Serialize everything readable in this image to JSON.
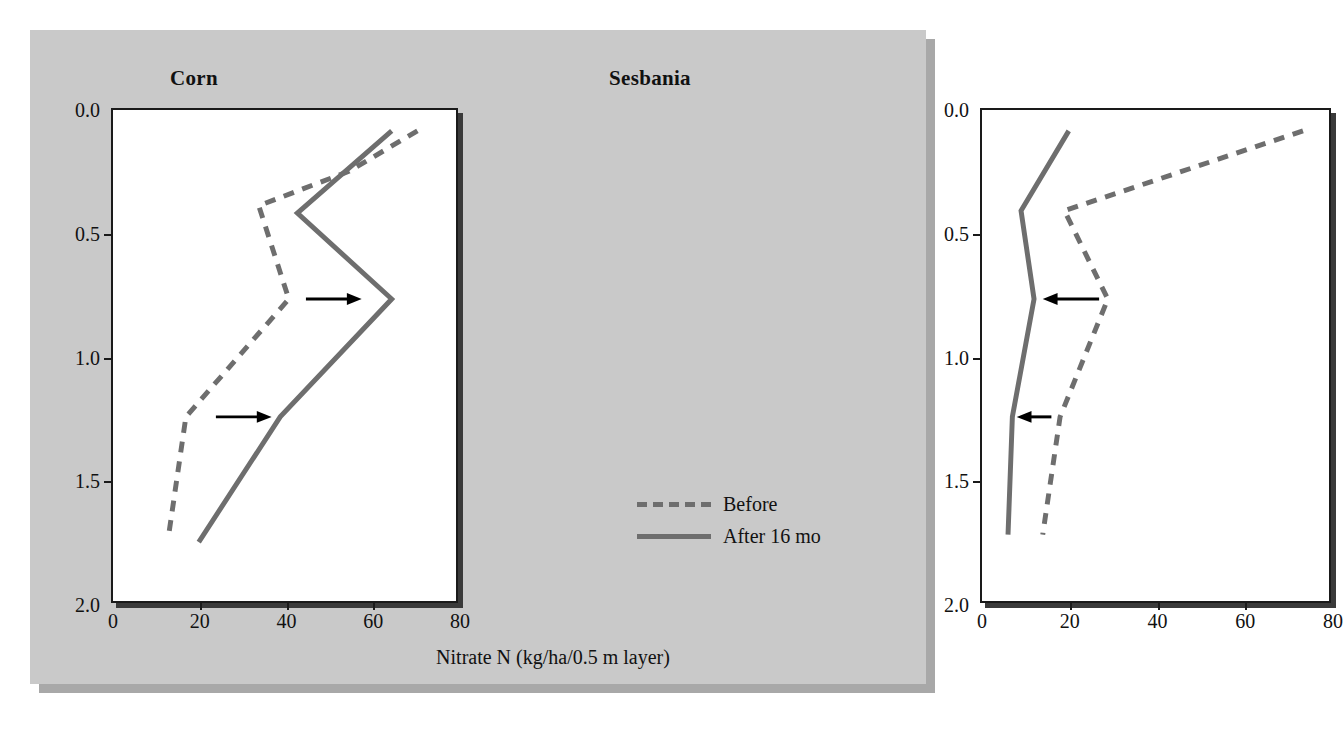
{
  "figure": {
    "background_color": "#c9c9c9",
    "plot_background_color": "#ffffff",
    "line_color": "#6e6e6e",
    "axis_color": "#1a1a1a",
    "arrow_color": "#000000"
  },
  "axis_title": "Nitrate N (kg/ha/0.5 m layer)",
  "legend": {
    "entries": [
      {
        "label": "Before",
        "style": "dashed"
      },
      {
        "label": "After 16 mo",
        "style": "solid"
      }
    ]
  },
  "chart_data": [
    {
      "type": "line",
      "title": "Corn",
      "xlabel": "Nitrate N (kg/ha/0.5 m layer)",
      "ylabel": "Depth (m)",
      "xlim": [
        0,
        80
      ],
      "ylim": [
        0,
        2.0
      ],
      "y_inverted": true,
      "grid": false,
      "legend_position": "bottom-right of right panel",
      "xticks": [
        0,
        20,
        40,
        60,
        80
      ],
      "yticks": [
        0.0,
        0.5,
        1.0,
        1.5,
        2.0
      ],
      "xticklabels": [
        "0",
        "20",
        "40",
        "60",
        "80"
      ],
      "yticklabels": [
        "0.0",
        "0.5",
        "1.0",
        "1.5",
        "2.0"
      ],
      "series": [
        {
          "name": "Before",
          "style": "dashed",
          "depth": [
            0.085,
            0.25,
            0.39,
            0.77,
            1.25,
            1.73
          ],
          "values": [
            71,
            55,
            34,
            41,
            17,
            13
          ]
        },
        {
          "name": "After 16 mo",
          "style": "solid",
          "depth": [
            0.085,
            0.42,
            0.77,
            1.25,
            1.76
          ],
          "values": [
            65,
            43,
            65,
            39,
            20
          ]
        }
      ],
      "annotations": [
        {
          "type": "arrow",
          "direction": "right",
          "depth": 0.77,
          "x_from": 45,
          "x_to": 58
        },
        {
          "type": "arrow",
          "direction": "right",
          "depth": 1.25,
          "x_from": 24,
          "x_to": 37
        }
      ]
    },
    {
      "type": "line",
      "title": "Sesbania",
      "xlabel": "Nitrate N (kg/ha/0.5 m layer)",
      "ylabel": "Depth (m)",
      "xlim": [
        0,
        80
      ],
      "ylim": [
        0,
        2.0
      ],
      "y_inverted": true,
      "grid": false,
      "xticks": [
        0,
        20,
        40,
        60,
        80
      ],
      "yticks": [
        0.0,
        0.5,
        1.0,
        1.5,
        2.0
      ],
      "xticklabels": [
        "0",
        "20",
        "40",
        "60",
        "80"
      ],
      "yticklabels": [
        "0.0",
        "0.5",
        "1.0",
        "1.5",
        "2.0"
      ],
      "series": [
        {
          "name": "Before",
          "style": "dashed",
          "depth": [
            0.085,
            0.41,
            0.77,
            1.25,
            1.73
          ],
          "values": [
            74,
            19,
            29,
            18,
            14
          ]
        },
        {
          "name": "After 16 mo",
          "style": "solid",
          "depth": [
            0.085,
            0.41,
            0.77,
            1.25,
            1.73
          ],
          "values": [
            20,
            9,
            12,
            7,
            6
          ]
        }
      ],
      "annotations": [
        {
          "type": "arrow",
          "direction": "left",
          "depth": 0.77,
          "x_from": 27,
          "x_to": 14
        },
        {
          "type": "arrow",
          "direction": "left",
          "depth": 1.25,
          "x_from": 16,
          "x_to": 8
        }
      ]
    }
  ]
}
